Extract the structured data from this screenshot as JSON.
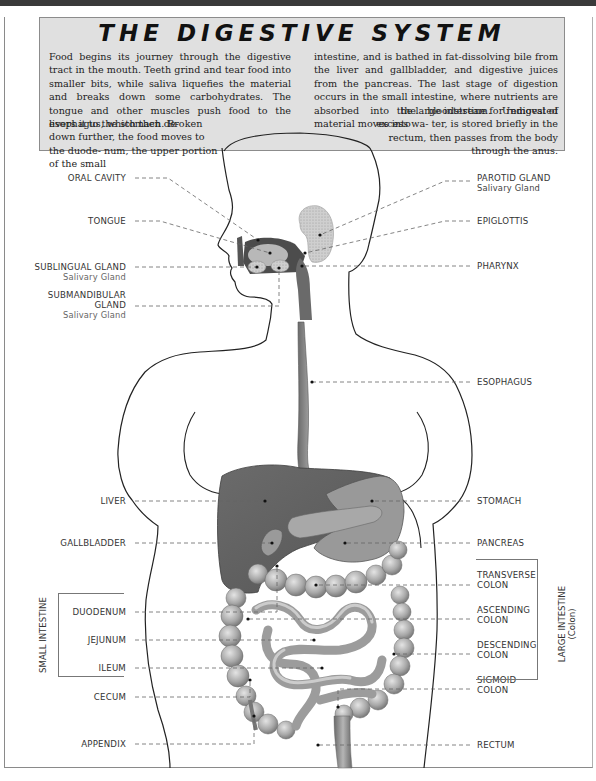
{
  "title": "THE DIGESTIVE SYSTEM",
  "intro": {
    "left_col": "Food begins its journey through the digestive tract in the mouth. Teeth grind and tear food into smaller bits, while saliva liquefies the material and breaks down some carbohydrates. The tongue and other muscles push food to the esophagus, which then de-",
    "left_col_tail": "livers it to the stomach. Broken down further, the food moves to the duode- num, the upper portion of the small",
    "right_col": "intestine, and is bathed in fat-dissolving bile from the liver and gallbladder, and digestive juices from the pancreas. The last stage of digestion occurs in the small intestine, where nutrients are absorbed into the bloodstream. Undigested material moves into",
    "right_col_tail": "the large intestine for removal of excess wa- ter, is stored briefly in the rectum, then passes from the body through the anus."
  },
  "labels_left": [
    {
      "id": "oral-cavity",
      "text": "ORAL CAVITY"
    },
    {
      "id": "tongue",
      "text": "TONGUE"
    },
    {
      "id": "sublingual-gland",
      "text": "SUBLINGUAL GLAND",
      "sub": "Salivary Gland"
    },
    {
      "id": "submandibular-gland",
      "text": "SUBMANDIBULAR",
      "text2": "GLAND",
      "sub": "Salivary Gland"
    },
    {
      "id": "liver",
      "text": "LIVER"
    },
    {
      "id": "gallbladder",
      "text": "GALLBLADDER"
    },
    {
      "id": "duodenum",
      "text": "DUODENUM"
    },
    {
      "id": "jejunum",
      "text": "JEJUNUM"
    },
    {
      "id": "ileum",
      "text": "ILEUM"
    },
    {
      "id": "cecum",
      "text": "CECUM"
    },
    {
      "id": "appendix",
      "text": "APPENDIX"
    }
  ],
  "labels_right": [
    {
      "id": "parotid-gland",
      "text": "PAROTID GLAND",
      "sub": "Salivary Gland"
    },
    {
      "id": "epiglottis",
      "text": "EPIGLOTTIS"
    },
    {
      "id": "pharynx",
      "text": "PHARYNX"
    },
    {
      "id": "esophagus",
      "text": "ESOPHAGUS"
    },
    {
      "id": "stomach",
      "text": "STOMACH"
    },
    {
      "id": "pancreas",
      "text": "PANCREAS"
    },
    {
      "id": "transverse-colon",
      "text": "TRANSVERSE",
      "text2": "COLON"
    },
    {
      "id": "ascending-colon",
      "text": "ASCENDING",
      "text2": "COLON"
    },
    {
      "id": "descending-colon",
      "text": "DESCENDING",
      "text2": "COLON"
    },
    {
      "id": "sigmoid-colon",
      "text": "SIGMOID",
      "text2": "COLON"
    },
    {
      "id": "rectum",
      "text": "RECTUM"
    }
  ],
  "groups": {
    "small_intestine": "SMALL INTESTINE",
    "large_intestine": "LARGE INTESTINE",
    "large_intestine_sub": "(Colon)"
  },
  "colors": {
    "header_bg": "#e0e0e0",
    "organ_dark": "#5e5e5e",
    "organ_mid": "#8a8a8a",
    "organ_light": "#b9b9b9",
    "leader_line": "#666666"
  }
}
